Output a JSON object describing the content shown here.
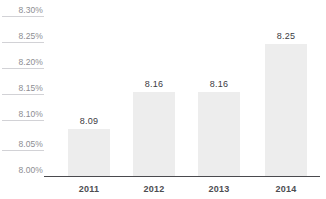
{
  "chart_data": {
    "type": "bar",
    "title": "",
    "subtitle": "",
    "xlabel": "",
    "ylabel": "",
    "categories": [
      "2011",
      "2012",
      "2013",
      "2014"
    ],
    "values": [
      8.09,
      8.16,
      8.16,
      8.25
    ],
    "value_labels": [
      "8.09",
      "8.16",
      "8.16",
      "8.25"
    ],
    "ylim": [
      8.0,
      8.3
    ],
    "ytick_values": [
      8.3,
      8.25,
      8.2,
      8.15,
      8.1,
      8.05,
      8.0
    ],
    "ytick_labels": [
      "8.30%",
      "8.25%",
      "8.20%",
      "8.15%",
      "8.10%",
      "8.05%",
      "8.00%"
    ],
    "grid": false,
    "tick_rules": true,
    "legend": "none",
    "bar_color": "#ededed",
    "axis_color": "#4a4a4e",
    "label_color": "#3b3b3f",
    "ytick_color": "#8d8d92",
    "background": "#ffffff"
  }
}
